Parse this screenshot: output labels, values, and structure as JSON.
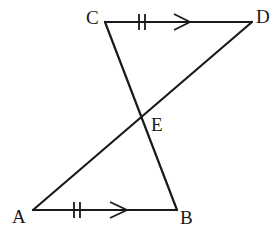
{
  "diagram": {
    "type": "geometry",
    "points": {
      "A": {
        "label": "A",
        "x": 33,
        "y": 210
      },
      "B": {
        "label": "B",
        "x": 177,
        "y": 210
      },
      "C": {
        "label": "C",
        "x": 105,
        "y": 22
      },
      "D": {
        "label": "D",
        "x": 252,
        "y": 22
      },
      "E": {
        "label": "E",
        "x": 141,
        "y": 117
      }
    },
    "segments": [
      {
        "from": "C",
        "to": "D",
        "marks": [
          "double-tick",
          "parallel-arrow"
        ]
      },
      {
        "from": "A",
        "to": "B",
        "marks": [
          "double-tick",
          "parallel-arrow"
        ]
      },
      {
        "from": "C",
        "to": "B",
        "marks": []
      },
      {
        "from": "A",
        "to": "D",
        "marks": []
      }
    ],
    "labels": {
      "A": "A",
      "B": "B",
      "C": "C",
      "D": "D",
      "E": "E"
    },
    "colors": {
      "stroke": "#1a1a1a",
      "background": "#ffffff"
    }
  }
}
